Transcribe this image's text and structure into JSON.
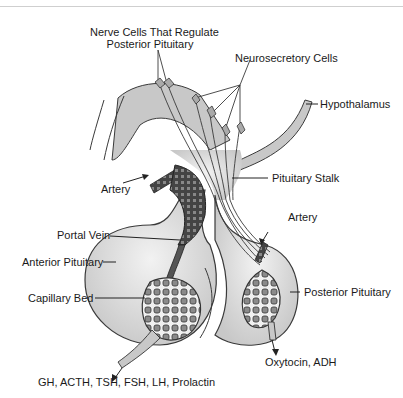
{
  "figure": {
    "title_cut_off": true,
    "colors": {
      "gland_fill": "#d0d0d0",
      "gland_stroke": "#3a3a3a",
      "capillary_fill": "#8a8a8a",
      "vessel_dark": "#333333",
      "background": "#ffffff"
    }
  },
  "labels": {
    "nerve_cells": [
      "Nerve Cells That Regulate",
      "Posterior Pituitary"
    ],
    "neurosecretory": "Neurosecretory Cells",
    "hypothalamus": "Hypothalamus",
    "artery_left": "Artery",
    "pituitary_stalk": "Pituitary Stalk",
    "artery_right": "Artery",
    "portal_vein": "Portal Vein",
    "anterior_pituitary": "Anterior Pituitary",
    "capillary_bed": "Capillary Bed",
    "posterior_pituitary": "Posterior Pituitary",
    "posterior_hormones": "Oxytocin, ADH",
    "anterior_hormones": "GH, ACTH, TSH, FSH, LH, Prolactin"
  }
}
